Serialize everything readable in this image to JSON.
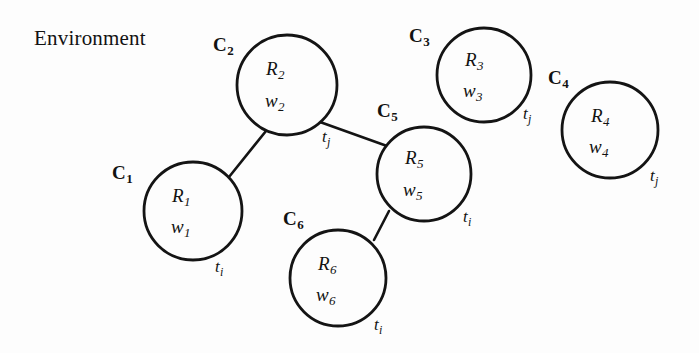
{
  "figure": {
    "caption": "Environment",
    "background_color": "#fdfdfd",
    "stroke_color": "#141414",
    "text_color": "#121212"
  },
  "nodes": [
    {
      "id": "C1",
      "cluster_prefix": "C",
      "cluster_index": "1",
      "robot": "R",
      "robot_index": "1",
      "weight": "w",
      "weight_index": "1",
      "time": "t",
      "time_index": "i",
      "cx": 193,
      "cy": 211,
      "r": 49
    },
    {
      "id": "C2",
      "cluster_prefix": "C",
      "cluster_index": "2",
      "robot": "R",
      "robot_index": "2",
      "weight": "w",
      "weight_index": "2",
      "time": "t",
      "time_index": "j",
      "cx": 287,
      "cy": 85,
      "r": 50
    },
    {
      "id": "C3",
      "cluster_prefix": "C",
      "cluster_index": "3",
      "robot": "R",
      "robot_index": "3",
      "weight": "w",
      "weight_index": "3",
      "time": "t",
      "time_index": "j",
      "cx": 484,
      "cy": 75,
      "r": 47
    },
    {
      "id": "C4",
      "cluster_prefix": "C",
      "cluster_index": "4",
      "robot": "R",
      "robot_index": "4",
      "weight": "w",
      "weight_index": "4",
      "time": "t",
      "time_index": "j",
      "cx": 610,
      "cy": 130,
      "r": 48
    },
    {
      "id": "C5",
      "cluster_prefix": "C",
      "cluster_index": "5",
      "robot": "R",
      "robot_index": "5",
      "weight": "w",
      "weight_index": "5",
      "time": "t",
      "time_index": "i",
      "cx": 424,
      "cy": 174,
      "r": 47
    },
    {
      "id": "C6",
      "cluster_prefix": "C",
      "cluster_index": "6",
      "robot": "R",
      "robot_index": "6",
      "weight": "w",
      "weight_index": "6",
      "time": "t",
      "time_index": "i",
      "cx": 338,
      "cy": 278,
      "r": 48
    }
  ],
  "edges": [
    {
      "id": "edge-c1-c2",
      "from": "C1",
      "to": "C2"
    },
    {
      "id": "edge-c2-c5",
      "from": "C2",
      "to": "C5"
    },
    {
      "id": "edge-c5-c6",
      "from": "C5",
      "to": "C6"
    }
  ]
}
